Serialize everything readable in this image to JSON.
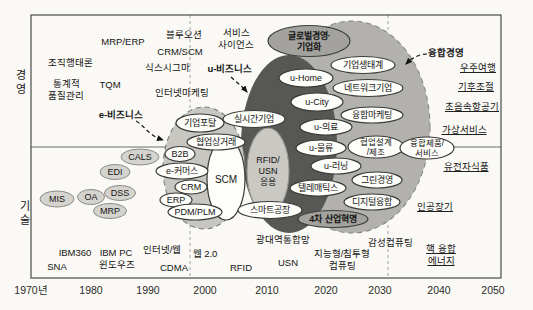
{
  "diagram": {
    "colors": {
      "paper": "#faf9f5",
      "frame": "#4a4a48",
      "divider": "#6f6f6d",
      "dashline": "#a3a3a0",
      "ink": "#141414",
      "blob_convergence": "#b2b1ad",
      "blob_ubusiness": "#575755",
      "blob_ebusiness": "#c7c6c1",
      "ellipse_white": "#fdfdfa",
      "ellipse_white_stroke": "#3a3a38",
      "ellipse_gray": "#d4d3ce",
      "ellipse_gray_stroke": "#8b8b88",
      "ellipse_mid": "#a3a29e",
      "ellipse_mid_stroke": "#3c3c3a",
      "ellipse_soft": "#c9c8c3",
      "ellipse_soft_stroke": "#97968f"
    },
    "frame": {
      "x": 31,
      "y": 15,
      "w": 470,
      "h": 263,
      "divider_y": 147,
      "dashed_x": [
        190,
        388
      ]
    },
    "axis_side_labels": [
      {
        "name": "y-axis-label-management",
        "text": "경\n영",
        "x": 21,
        "y": 79,
        "fs": 11,
        "lh": 14
      },
      {
        "name": "y-axis-label-technology",
        "text": "기\n술",
        "x": 25,
        "y": 210,
        "fs": 11,
        "lh": 14
      }
    ],
    "x_ticks": {
      "y": 294,
      "fs": 10.5,
      "items": [
        {
          "label": "1970년",
          "x": 31
        },
        {
          "label": "1980",
          "x": 91
        },
        {
          "label": "1990",
          "x": 148
        },
        {
          "label": "2000",
          "x": 205
        },
        {
          "label": "2010",
          "x": 267
        },
        {
          "label": "2020",
          "x": 326
        },
        {
          "label": "2030",
          "x": 380
        },
        {
          "label": "2040",
          "x": 439
        },
        {
          "label": "2050",
          "x": 493
        }
      ]
    },
    "blobs": [
      {
        "name": "era-blob-convergence",
        "cx": 352,
        "cy": 127,
        "rx": 78,
        "ry": 106,
        "fill": "blob_convergence",
        "stroke": "#88888a",
        "dash": "5 4"
      },
      {
        "name": "era-blob-ubusiness",
        "cx": 289,
        "cy": 144,
        "rx": 48,
        "ry": 89,
        "fill": "blob_ubusiness",
        "stroke": "none",
        "dash": ""
      },
      {
        "name": "era-blob-ebusiness",
        "cx": 204,
        "cy": 168,
        "rx": 41,
        "ry": 61,
        "fill": "blob_ebusiness",
        "stroke": "#7c7c78",
        "dash": "5 4"
      }
    ],
    "ellipse_labels": [
      {
        "name": "global-management-enterprise",
        "text": "글로벌경영·\n기업화",
        "cx": 309,
        "cy": 41,
        "rx": 41,
        "ry": 15.5,
        "style": "mid",
        "bold": true,
        "fs": 9
      },
      {
        "name": "scm",
        "text": "SCM",
        "cx": 226,
        "cy": 179,
        "rx": 19,
        "ry": 41,
        "style": "white",
        "fs": 10
      },
      {
        "name": "rfid-usn-application",
        "text": "RFID/\nUSN\n응용",
        "cx": 268,
        "cy": 171,
        "rx": 21,
        "ry": 43,
        "style": "soft",
        "fs": 9
      },
      {
        "name": "enterprise-portal",
        "text": "기업포탈",
        "cx": 200,
        "cy": 123,
        "rx": 24,
        "ry": 9,
        "style": "white"
      },
      {
        "name": "realtime-enterprise",
        "text": "실시간기업",
        "cx": 254,
        "cy": 119,
        "rx": 31,
        "ry": 8.5,
        "style": "white"
      },
      {
        "name": "collaborative-commerce",
        "text": "협업상거래",
        "cx": 216,
        "cy": 142,
        "rx": 29,
        "ry": 8,
        "style": "white"
      },
      {
        "name": "b2b",
        "text": "B2B",
        "cx": 180,
        "cy": 154,
        "rx": 15,
        "ry": 7.5,
        "style": "white"
      },
      {
        "name": "e-commerce",
        "text": "e-커머스",
        "cx": 182,
        "cy": 171,
        "rx": 26,
        "ry": 8,
        "style": "white"
      },
      {
        "name": "crm",
        "text": "CRM",
        "cx": 191,
        "cy": 187,
        "rx": 16,
        "ry": 7,
        "style": "white"
      },
      {
        "name": "erp",
        "text": "ERP",
        "cx": 176,
        "cy": 200,
        "rx": 16,
        "ry": 7,
        "style": "white"
      },
      {
        "name": "pdm-plm",
        "text": "PDM/PLM",
        "cx": 195,
        "cy": 212,
        "rx": 27,
        "ry": 8,
        "style": "white"
      },
      {
        "name": "smart-factory",
        "text": "스마트공장",
        "cx": 270,
        "cy": 210,
        "rx": 32,
        "ry": 8.5,
        "style": "white"
      },
      {
        "name": "cals",
        "text": "CALS",
        "cx": 140,
        "cy": 157,
        "rx": 19,
        "ry": 8,
        "style": "gray"
      },
      {
        "name": "edi",
        "text": "EDI",
        "cx": 115,
        "cy": 172,
        "rx": 15,
        "ry": 7.5,
        "style": "gray"
      },
      {
        "name": "mis",
        "text": "MIS",
        "cx": 57,
        "cy": 199,
        "rx": 17,
        "ry": 8,
        "style": "gray"
      },
      {
        "name": "oa",
        "text": "OA",
        "cx": 91,
        "cy": 197,
        "rx": 13.5,
        "ry": 7.5,
        "style": "gray"
      },
      {
        "name": "dss",
        "text": "DSS",
        "cx": 120,
        "cy": 193,
        "rx": 15.5,
        "ry": 7.5,
        "style": "gray"
      },
      {
        "name": "mrp",
        "text": "MRP",
        "cx": 110,
        "cy": 211,
        "rx": 16.5,
        "ry": 7.5,
        "style": "gray"
      },
      {
        "name": "u-home",
        "text": "u-Home",
        "cx": 306,
        "cy": 78,
        "rx": 27,
        "ry": 9,
        "style": "white"
      },
      {
        "name": "u-city",
        "text": "u-City",
        "cx": 317,
        "cy": 102,
        "rx": 26,
        "ry": 9,
        "style": "white"
      },
      {
        "name": "u-medical",
        "text": "u-의료",
        "cx": 326,
        "cy": 127,
        "rx": 26,
        "ry": 8,
        "style": "white"
      },
      {
        "name": "u-logistics",
        "text": "u-물류",
        "cx": 321,
        "cy": 148,
        "rx": 25,
        "ry": 8,
        "style": "white"
      },
      {
        "name": "u-learning",
        "text": "u-러닝",
        "cx": 336,
        "cy": 166,
        "rx": 25,
        "ry": 8,
        "style": "white"
      },
      {
        "name": "telematics",
        "text": "텔레매틱스",
        "cx": 318,
        "cy": 188,
        "rx": 28,
        "ry": 8,
        "style": "white"
      },
      {
        "name": "business-ecosystem",
        "text": "기업생태계",
        "cx": 363,
        "cy": 65,
        "rx": 32,
        "ry": 8.5,
        "style": "white"
      },
      {
        "name": "network-enterprise",
        "text": "네트워크기업",
        "cx": 368,
        "cy": 88,
        "rx": 35,
        "ry": 8.5,
        "style": "white"
      },
      {
        "name": "convergence-marketing",
        "text": "융합마케팅",
        "cx": 372,
        "cy": 115,
        "rx": 31,
        "ry": 8,
        "style": "white"
      },
      {
        "name": "collaborative-design-mfg",
        "text": "협업설계\n/제조",
        "cx": 376,
        "cy": 147,
        "rx": 28,
        "ry": 11,
        "style": "white",
        "fs": 8.5
      },
      {
        "name": "convergence-product-service",
        "text": "융합제품/\n서비스",
        "cx": 427,
        "cy": 148,
        "rx": 27,
        "ry": 11,
        "style": "white",
        "fs": 8.5
      },
      {
        "name": "green-management",
        "text": "그린경영",
        "cx": 377,
        "cy": 180,
        "rx": 25,
        "ry": 8,
        "style": "white"
      },
      {
        "name": "digital-convergence",
        "text": "디지털융합",
        "cx": 372,
        "cy": 202,
        "rx": 28,
        "ry": 8,
        "style": "white"
      },
      {
        "name": "fourth-industrial-revolution",
        "text": "4차 산업혁명",
        "cx": 333,
        "cy": 219,
        "rx": 35,
        "ry": 8.5,
        "style": "mid",
        "bold": true
      }
    ],
    "text_labels": [
      {
        "name": "label-org-behavior",
        "text": "조직행태론",
        "x": 70,
        "y": 66
      },
      {
        "name": "label-mrp-erp",
        "text": "MRP/ERP",
        "x": 123,
        "y": 45
      },
      {
        "name": "label-statistical-quality",
        "text": "통계적\n품질관리",
        "x": 66,
        "y": 87
      },
      {
        "name": "label-tqm",
        "text": "TQM",
        "x": 110,
        "y": 88
      },
      {
        "name": "label-blue-ocean",
        "text": "블루오션",
        "x": 184,
        "y": 38
      },
      {
        "name": "label-crm-scm",
        "text": "CRM/SCM",
        "x": 180,
        "y": 55
      },
      {
        "name": "label-six-sigma",
        "text": "식스시그마",
        "x": 167,
        "y": 71
      },
      {
        "name": "label-service-science",
        "text": "서비스\n사이언스",
        "x": 236,
        "y": 36
      },
      {
        "name": "label-u-business",
        "text": "u-비즈니스",
        "x": 230,
        "y": 72,
        "bold": true
      },
      {
        "name": "label-internet-marketing",
        "text": "인터넷마케팅",
        "x": 182,
        "y": 96
      },
      {
        "name": "label-e-business",
        "text": "e-비즈니스",
        "x": 121,
        "y": 118,
        "bold": true
      },
      {
        "name": "label-convergence-management",
        "text": "융합경영",
        "x": 446,
        "y": 56,
        "bold": true
      },
      {
        "name": "label-space-travel",
        "text": "우주여행",
        "x": 478,
        "y": 71,
        "underline": true
      },
      {
        "name": "label-climate-control",
        "text": "기후조절",
        "x": 476,
        "y": 90,
        "underline": true
      },
      {
        "name": "label-supersonic-aircraft",
        "text": "초음속항공기",
        "x": 472,
        "y": 110,
        "underline": true
      },
      {
        "name": "label-virtual-service",
        "text": "가상서비스",
        "x": 464,
        "y": 133,
        "underline": true
      },
      {
        "name": "label-genetic-food",
        "text": "유전자식품",
        "x": 466,
        "y": 170,
        "underline": true
      },
      {
        "name": "label-artificial-organs",
        "text": "인공장기",
        "x": 435,
        "y": 210,
        "underline": true
      },
      {
        "name": "label-nuclear-fusion-energy",
        "text": "핵 융합\n에너지",
        "x": 441,
        "y": 252,
        "underline": true
      },
      {
        "name": "label-ibm360",
        "text": "IBM360",
        "x": 75,
        "y": 256
      },
      {
        "name": "label-ibm-pc",
        "text": "IBM PC",
        "x": 116,
        "y": 256
      },
      {
        "name": "label-internet-web",
        "text": "인터넷/웹",
        "x": 162,
        "y": 253
      },
      {
        "name": "label-web20",
        "text": "웹 2.0",
        "x": 205,
        "y": 257
      },
      {
        "name": "label-broadband-network",
        "text": "광대역통합망",
        "x": 283,
        "y": 243
      },
      {
        "name": "label-affective-computing",
        "text": "감성컴퓨팅",
        "x": 390,
        "y": 246
      },
      {
        "name": "label-sna",
        "text": "SNA",
        "x": 57,
        "y": 270
      },
      {
        "name": "label-windows",
        "text": "윈도우즈",
        "x": 117,
        "y": 268
      },
      {
        "name": "label-cdma",
        "text": "CDMA",
        "x": 174,
        "y": 271
      },
      {
        "name": "label-rfid",
        "text": "RFID",
        "x": 241,
        "y": 271
      },
      {
        "name": "label-usn",
        "text": "USN",
        "x": 288,
        "y": 266
      },
      {
        "name": "label-pervasive-computing",
        "text": "지능형/침투형\n컴퓨팅",
        "x": 342,
        "y": 257
      }
    ],
    "arrows": [
      {
        "name": "arrow-e-business",
        "path": "M 136 121 C 146 127, 148 135, 163 140"
      },
      {
        "name": "arrow-u-business",
        "path": "M 231 77 C 236 82, 242 86, 247 92"
      },
      {
        "name": "arrow-convergence-management",
        "path": "M 427 54 C 419 54, 412 58, 406 64"
      }
    ]
  }
}
